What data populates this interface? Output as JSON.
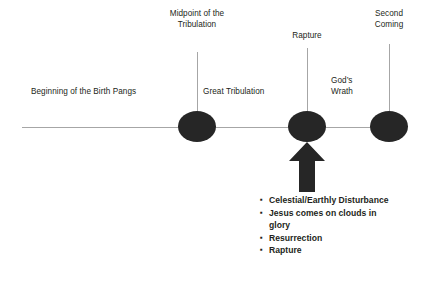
{
  "diagram": {
    "background_color": "#ffffff",
    "line_color": "#a6a6a6",
    "node_color": "#262626",
    "text_color": "#231f20"
  },
  "labels": {
    "birth_pangs": "Beginning of the Birth Pangs",
    "midpoint": "Midpoint of the\nTribulation",
    "great_tribulation": "Great Tribulation",
    "rapture": "Rapture",
    "gods_wrath": "God’s\nWrath",
    "second_coming": "Second\nComing"
  },
  "bullets": {
    "marker": "▪",
    "items": [
      "Celestial/Earthly Disturbance",
      "Jesus comes on clouds in glory",
      "Resurrection",
      "Rapture"
    ]
  }
}
